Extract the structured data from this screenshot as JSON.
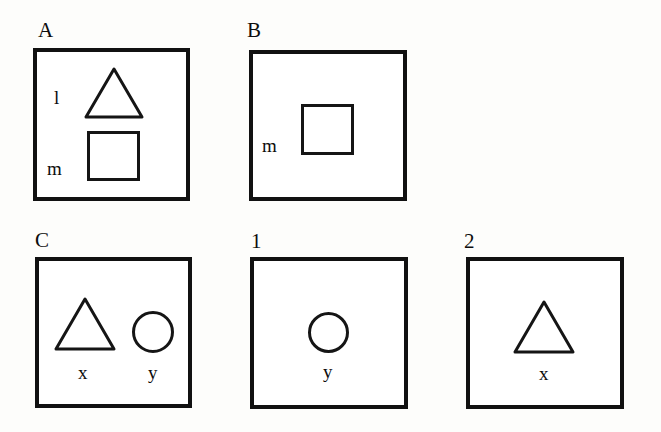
{
  "figure": {
    "background_color": "#fdfdfb",
    "ink_color": "#111111",
    "width": 661,
    "height": 432,
    "panels": [
      {
        "id": "panel-a",
        "label": "A",
        "label_x": 38,
        "label_y": 20,
        "frame": {
          "x": 33,
          "y": 48,
          "w": 157,
          "h": 153
        },
        "shapes": [
          {
            "kind": "triangle",
            "name": "triangle-shape",
            "x": 84,
            "y": 67,
            "w": 60,
            "h": 52
          },
          {
            "kind": "square",
            "name": "square-shape",
            "x": 87,
            "y": 131,
            "w": 53,
            "h": 50
          }
        ],
        "labels": [
          {
            "text": "l",
            "name": "shape-label-l",
            "x": 54,
            "y": 88
          },
          {
            "text": "m",
            "name": "shape-label-m",
            "x": 47,
            "y": 159
          }
        ]
      },
      {
        "id": "panel-b",
        "label": "B",
        "label_x": 247,
        "label_y": 20,
        "frame": {
          "x": 249,
          "y": 50,
          "w": 158,
          "h": 151
        },
        "shapes": [
          {
            "kind": "square",
            "name": "square-shape",
            "x": 301,
            "y": 104,
            "w": 53,
            "h": 51
          }
        ],
        "labels": [
          {
            "text": "m",
            "name": "shape-label-m",
            "x": 262,
            "y": 136
          }
        ]
      },
      {
        "id": "panel-c",
        "label": "C",
        "label_x": 35,
        "label_y": 230,
        "frame": {
          "x": 35,
          "y": 257,
          "w": 157,
          "h": 151
        },
        "shapes": [
          {
            "kind": "triangle",
            "name": "triangle-shape",
            "x": 54,
            "y": 297,
            "w": 62,
            "h": 54
          },
          {
            "kind": "circle",
            "name": "circle-shape",
            "x": 132,
            "y": 311,
            "w": 42,
            "h": 42
          }
        ],
        "labels": [
          {
            "text": "x",
            "name": "shape-label-x",
            "x": 78,
            "y": 363
          },
          {
            "text": "y",
            "name": "shape-label-y",
            "x": 148,
            "y": 363
          }
        ]
      },
      {
        "id": "panel-1",
        "label": "1",
        "label_x": 251,
        "label_y": 231,
        "frame": {
          "x": 250,
          "y": 257,
          "w": 158,
          "h": 152
        },
        "shapes": [
          {
            "kind": "circle",
            "name": "circle-shape",
            "x": 308,
            "y": 312,
            "w": 41,
            "h": 41
          }
        ],
        "labels": [
          {
            "text": "y",
            "name": "shape-label-y",
            "x": 323,
            "y": 362
          }
        ]
      },
      {
        "id": "panel-2",
        "label": "2",
        "label_x": 464,
        "label_y": 231,
        "frame": {
          "x": 466,
          "y": 257,
          "w": 158,
          "h": 152
        },
        "shapes": [
          {
            "kind": "triangle",
            "name": "triangle-shape",
            "x": 513,
            "y": 300,
            "w": 62,
            "h": 54
          }
        ],
        "labels": [
          {
            "text": "x",
            "name": "shape-label-x",
            "x": 539,
            "y": 364
          }
        ]
      }
    ]
  }
}
